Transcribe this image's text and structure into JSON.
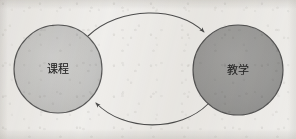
{
  "figure": {
    "type": "relationship-diagram",
    "background_color": "#f2f1ef"
  },
  "nodes": [
    {
      "id": "course",
      "label": "课程",
      "shape": "circle",
      "fill_color": "#c6c6c6",
      "stroke_color": "#5a5a5a",
      "center_x": 58,
      "center_y": 69,
      "radius": 44
    },
    {
      "id": "teaching",
      "label": "教学",
      "shape": "circle",
      "fill_color": "#9c9c9c",
      "stroke_color": "#555555",
      "center_x": 238,
      "center_y": 70,
      "radius": 45
    }
  ],
  "edges": [
    {
      "id": "course-to-teaching",
      "from": "course",
      "to": "teaching",
      "style": "curved-arc",
      "direction": "rightward",
      "arrowhead": "at-teaching",
      "stroke_color": "#4e4e4e"
    },
    {
      "id": "teaching-to-course",
      "from": "teaching",
      "to": "course",
      "style": "curved-arc",
      "direction": "leftward",
      "arrowhead": "at-course",
      "stroke_color": "#4e4e4e"
    }
  ]
}
